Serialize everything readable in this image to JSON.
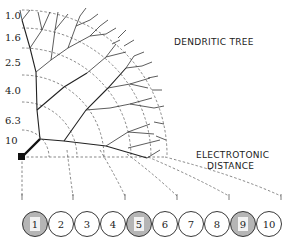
{
  "labels": {
    "dendritic_tree": "DENDRITIC TREE",
    "electrotonic_line1": "ELECTROTONIC",
    "electrotonic_line2": "DISTANCE"
  },
  "diameter_axis": {
    "ticks": [
      "1.0",
      "1.6",
      "2.5",
      "4.0",
      "6.3",
      "10"
    ]
  },
  "compartments": [
    {
      "label": "1",
      "shaded": true
    },
    {
      "label": "2",
      "shaded": false
    },
    {
      "label": "3",
      "shaded": false
    },
    {
      "label": "4",
      "shaded": false
    },
    {
      "label": "5",
      "shaded": true
    },
    {
      "label": "6",
      "shaded": false
    },
    {
      "label": "7",
      "shaded": false
    },
    {
      "label": "8",
      "shaded": false
    },
    {
      "label": "9",
      "shaded": true
    },
    {
      "label": "10",
      "shaded": false
    }
  ],
  "colors": {
    "shaded_fill": "#b5b5b5",
    "stroke": "#222222"
  }
}
